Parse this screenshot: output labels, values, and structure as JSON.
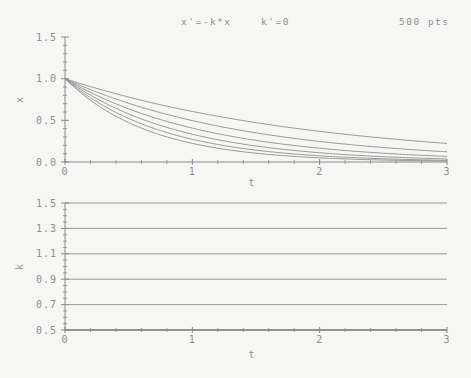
{
  "header": {
    "equation_x": "x'=-k*x",
    "equation_k": "k'=0",
    "points": "500 pts"
  },
  "colors": {
    "background": "#f6f6f4",
    "text": "#8f8f8f",
    "axis": "#8a8a8a",
    "curve": "#8f8f8f",
    "heavy_axis": "#7a7a7a"
  },
  "chart_data": [
    {
      "id": "x-vs-t",
      "type": "line",
      "title": "x'=-k*x",
      "xlabel": "t",
      "ylabel": "x",
      "xlim": [
        0,
        3
      ],
      "ylim": [
        0,
        1.5
      ],
      "x_tick_values": [
        0,
        1,
        2,
        3
      ],
      "x_tick_labels": [
        "0",
        "1",
        "2",
        "3"
      ],
      "x_minor_step": 0.2,
      "y_tick_values": [
        0,
        0.5,
        1.0,
        1.5
      ],
      "y_tick_labels": [
        "0.0",
        "0.5",
        "1.0",
        "1.5"
      ],
      "y_minor_step": 0.1,
      "model": "x(t) = x0 * exp(-k*t)",
      "x0": 1.0,
      "points_per_curve": 500,
      "series": [
        {
          "name": "k=0.5",
          "k": 0.5,
          "x_at_t0": 1.0,
          "x_at_t3": 0.223
        },
        {
          "name": "k=0.7",
          "k": 0.7,
          "x_at_t0": 1.0,
          "x_at_t3": 0.122
        },
        {
          "name": "k=0.9",
          "k": 0.9,
          "x_at_t0": 1.0,
          "x_at_t3": 0.067
        },
        {
          "name": "k=1.1",
          "k": 1.1,
          "x_at_t0": 1.0,
          "x_at_t3": 0.037
        },
        {
          "name": "k=1.3",
          "k": 1.3,
          "x_at_t0": 1.0,
          "x_at_t3": 0.02
        },
        {
          "name": "k=1.5",
          "k": 1.5,
          "x_at_t0": 1.0,
          "x_at_t3": 0.011
        }
      ]
    },
    {
      "id": "k-vs-t",
      "type": "line",
      "title": "k'=0",
      "xlabel": "t",
      "ylabel": "k",
      "xlim": [
        0,
        3
      ],
      "ylim": [
        0.5,
        1.5
      ],
      "x_tick_values": [
        0,
        1,
        2,
        3
      ],
      "x_tick_labels": [
        "0",
        "1",
        "2",
        "3"
      ],
      "x_minor_step": 0.2,
      "y_tick_values": [
        0.5,
        0.7,
        0.9,
        1.1,
        1.3,
        1.5
      ],
      "y_tick_labels": [
        "0.5",
        "0.7",
        "0.9",
        "1.1",
        "1.3",
        "1.5"
      ],
      "y_minor_step": 0.05,
      "model": "k(t) = const",
      "series": [
        {
          "name": "k=0.5",
          "value": 0.5
        },
        {
          "name": "k=0.7",
          "value": 0.7
        },
        {
          "name": "k=0.9",
          "value": 0.9
        },
        {
          "name": "k=1.1",
          "value": 1.1
        },
        {
          "name": "k=1.3",
          "value": 1.3
        },
        {
          "name": "k=1.5",
          "value": 1.5
        }
      ]
    }
  ]
}
